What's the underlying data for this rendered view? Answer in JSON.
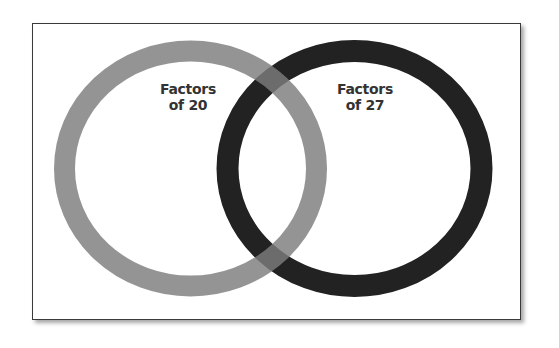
{
  "diagram": {
    "type": "venn",
    "sets": [
      {
        "id": "set-a",
        "label_line1": "Factors",
        "label_line2": "of 20",
        "color": "#7d7d7d"
      },
      {
        "id": "set-b",
        "label_line1": "Factors",
        "label_line2": "of 27",
        "color": "#222222"
      }
    ],
    "overlap_color": "#4a4a4a",
    "frame_border_color": "#3a3a3a",
    "background": "#ffffff"
  }
}
